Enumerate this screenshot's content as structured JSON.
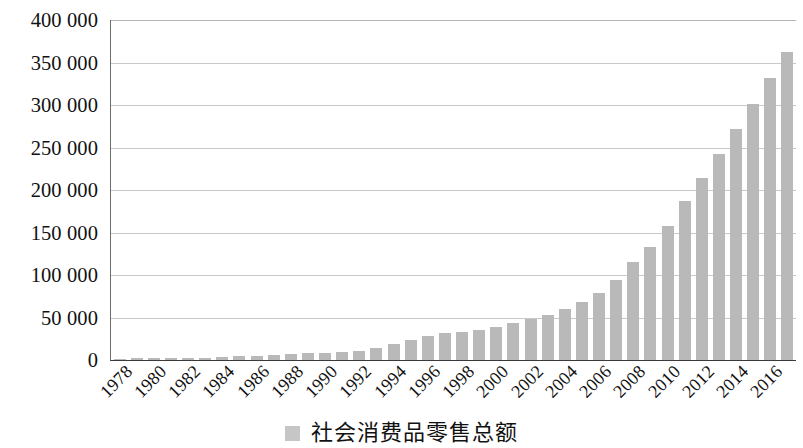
{
  "chart_data": {
    "type": "bar",
    "title": "",
    "subtitle": "",
    "xlabel": "",
    "ylabel": "",
    "grid": true,
    "legend_position": "bottom-center",
    "ylim": [
      0,
      400000
    ],
    "ytick_step": 50000,
    "ytick_labels": [
      "400 000",
      "350 000",
      "300 000",
      "250 000",
      "200 000",
      "150 000",
      "100 000",
      "50 000",
      "0"
    ],
    "ytick_values": [
      400000,
      350000,
      300000,
      250000,
      200000,
      150000,
      100000,
      50000,
      0
    ],
    "xtick_labels": [
      "1978",
      "1980",
      "1982",
      "1984",
      "1986",
      "1988",
      "1990",
      "1992",
      "1994",
      "1996",
      "1998",
      "2000",
      "2002",
      "2004",
      "2006",
      "2008",
      "2010",
      "2012",
      "2014",
      "2016"
    ],
    "categories": [
      "1978",
      "1979",
      "1980",
      "1981",
      "1982",
      "1983",
      "1984",
      "1985",
      "1986",
      "1987",
      "1988",
      "1989",
      "1990",
      "1991",
      "1992",
      "1993",
      "1994",
      "1995",
      "1996",
      "1997",
      "1998",
      "1999",
      "2000",
      "2001",
      "2002",
      "2003",
      "2004",
      "2005",
      "2006",
      "2007",
      "2008",
      "2009",
      "2010",
      "2011",
      "2012",
      "2013",
      "2014",
      "2015",
      "2016",
      "2017"
    ],
    "series": [
      {
        "name": "社会消费品零售总额",
        "color": "#b9b9b9",
        "values": [
          1559,
          1800,
          2140,
          2350,
          2570,
          2849,
          3376,
          4305,
          4950,
          5820,
          7440,
          8101,
          8300,
          9415,
          10993,
          14270,
          18622,
          23613,
          28360,
          31252,
          33378,
          35647,
          39105,
          43055,
          48135,
          52516,
          59501,
          68353,
          79145,
          93571,
          114830,
          132678,
          158008,
          187205,
          214432,
          242842,
          271896,
          300930,
          332316,
          362620
        ]
      }
    ],
    "annotations": []
  },
  "legend": {
    "swatch_icon": "legend-swatch-icon",
    "label": "社会消费品零售总额"
  }
}
